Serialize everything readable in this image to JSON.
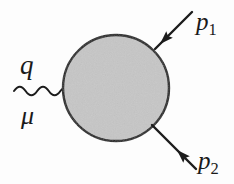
{
  "figure": {
    "kind": "feynman-diagram",
    "background_color": "#fdfdfd",
    "width": 234,
    "height": 184
  },
  "blob": {
    "name": "interaction-blob",
    "shape": "circle",
    "center_x": 116,
    "center_y": 88,
    "radius": 53,
    "fill_color": "#c6c6c6",
    "stroke_color": "#1c1c1c",
    "stroke_width": 2.4
  },
  "photon": {
    "name": "photon-wavy-line",
    "label_momentum": "q",
    "label_index": "μ",
    "x_start": 14,
    "x_end": 66,
    "y_center": 91,
    "amplitude": 6,
    "cycles": 4.5,
    "stroke_color": "#1c1c1c",
    "stroke_width": 2.0
  },
  "lines": [
    {
      "name": "momentum-line-p1",
      "label": "p",
      "subscript": "1",
      "direction": "incoming",
      "x1": 192,
      "y1": 12,
      "x2": 155,
      "y2": 49,
      "arrow_at_x": 166,
      "arrow_at_y": 38,
      "arrow_angle_deg": 135,
      "stroke_color": "#1c1c1c",
      "stroke_width": 2.4
    },
    {
      "name": "momentum-line-p2",
      "label": "p",
      "subscript": "2",
      "direction": "outgoing",
      "x1": 153,
      "y1": 126,
      "x2": 196,
      "y2": 169,
      "arrow_at_x": 172,
      "arrow_at_y": 145,
      "arrow_angle_deg": 45,
      "stroke_color": "#1c1c1c",
      "stroke_width": 2.4
    }
  ],
  "labels": {
    "q": "q",
    "mu": "μ",
    "p1_base": "p",
    "p1_sub": "1",
    "p2_base": "p",
    "p2_sub": "2"
  }
}
